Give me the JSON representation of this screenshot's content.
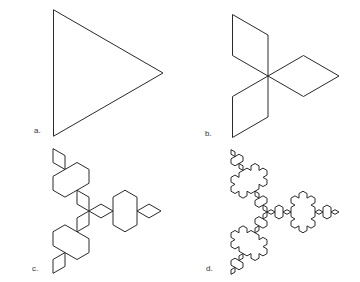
{
  "figure": {
    "stroke_color": "#2a2a2a",
    "background": "#ffffff",
    "panels": [
      {
        "id": "a",
        "label": "a.",
        "iterations": 0,
        "center": [
          90,
          73
        ],
        "radius": 73,
        "rotation_deg": 0,
        "label_pos": [
          34,
          133
        ]
      },
      {
        "id": "b",
        "label": "b.",
        "iterations": 1,
        "center": [
          268,
          76
        ],
        "radius": 71,
        "rotation_deg": 0,
        "label_pos": [
          205,
          136
        ]
      },
      {
        "id": "c",
        "label": "c.",
        "iterations": 2,
        "center": [
          89,
          211
        ],
        "radius": 72,
        "rotation_deg": 0,
        "label_pos": [
          32,
          271
        ]
      },
      {
        "id": "d",
        "label": "d.",
        "iterations": 3,
        "center": [
          267,
          212
        ],
        "radius": 72,
        "rotation_deg": 0,
        "label_pos": [
          206,
          271
        ]
      }
    ]
  }
}
